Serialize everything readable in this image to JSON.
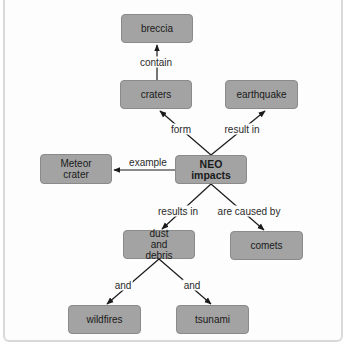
{
  "diagram": {
    "type": "concept-map",
    "colors": {
      "node_fill": "#a3a3a3",
      "node_border": "#8a8a8a",
      "line": "#1a1a1a",
      "background": "#fdfdfd"
    },
    "nodes": {
      "breccia": "breccia",
      "craters": "craters",
      "earthquake": "earthquake",
      "meteor_crater": "Meteor crater",
      "neo_impacts": "NEO impacts",
      "dust_and_debris": "dust and debris",
      "comets": "comets",
      "wildfires": "wildfires",
      "tsunami": "tsunami"
    },
    "links": [
      {
        "from": "craters",
        "to": "breccia",
        "label": "contain"
      },
      {
        "from": "neo_impacts",
        "to": "craters",
        "label": "form"
      },
      {
        "from": "neo_impacts",
        "to": "earthquake",
        "label": "result in"
      },
      {
        "from": "neo_impacts",
        "to": "meteor_crater",
        "label": "example"
      },
      {
        "from": "neo_impacts",
        "to": "dust_and_debris",
        "label": "results in"
      },
      {
        "from": "neo_impacts",
        "to": "comets",
        "label": "are caused by"
      },
      {
        "from": "dust_and_debris",
        "to": "wildfires",
        "label": "and"
      },
      {
        "from": "dust_and_debris",
        "to": "tsunami",
        "label": "and"
      }
    ]
  }
}
